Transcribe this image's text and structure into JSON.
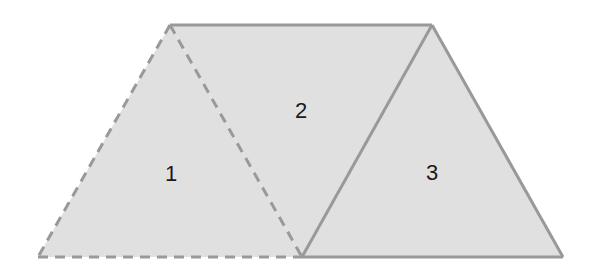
{
  "diagram": {
    "fill_color": "#e0e0e0",
    "stroke_color": "#999999",
    "vertices": {
      "top_left": [
        170,
        25
      ],
      "top_right": [
        432,
        25
      ],
      "bottom_left": [
        38,
        257
      ],
      "bottom_mid": [
        302,
        257
      ],
      "bottom_right": [
        563,
        257
      ]
    },
    "triangles": [
      {
        "id": "1",
        "label": "1",
        "style": "dashed",
        "label_pos": [
          171,
          181
        ]
      },
      {
        "id": "2",
        "label": "2",
        "style": "mixed",
        "label_pos": [
          301,
          118
        ]
      },
      {
        "id": "3",
        "label": "3",
        "style": "solid",
        "label_pos": [
          432,
          180
        ]
      }
    ]
  }
}
